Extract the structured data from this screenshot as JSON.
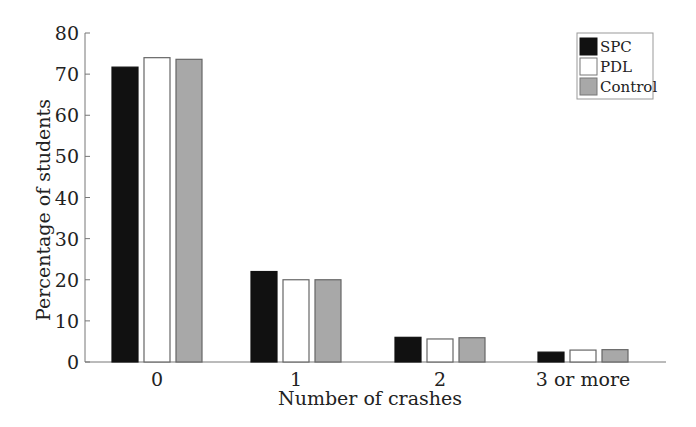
{
  "chart_data": {
    "type": "bar",
    "title": "",
    "xlabel": "Number of crashes",
    "ylabel": "Percentage of students",
    "categories": [
      "0",
      "1",
      "2",
      "3 or more"
    ],
    "series": [
      {
        "name": "SPC",
        "color": "#111111",
        "values": [
          71.7,
          22.0,
          6.0,
          2.4
        ]
      },
      {
        "name": "PDL",
        "color": "#ffffff",
        "values": [
          74.0,
          20.0,
          5.6,
          2.9
        ]
      },
      {
        "name": "Control",
        "color": "#a8a8a8",
        "values": [
          73.6,
          20.0,
          5.9,
          3.0
        ]
      }
    ],
    "ylim": [
      0,
      80
    ],
    "yticks": [
      0,
      10,
      20,
      30,
      40,
      50,
      60,
      70,
      80
    ],
    "grid": false,
    "legend_position": "top-right"
  }
}
